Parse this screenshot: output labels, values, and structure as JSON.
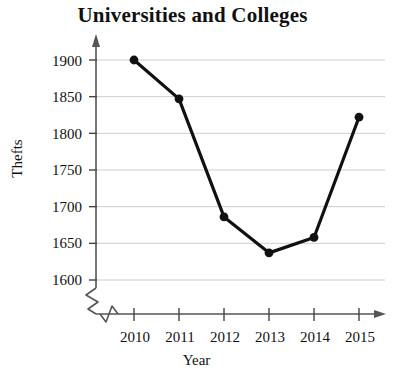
{
  "chart_data": {
    "type": "line",
    "title": "Universities and Colleges",
    "xlabel": "Year",
    "ylabel": "Thefts",
    "categories": [
      "2010",
      "2011",
      "2012",
      "2013",
      "2014",
      "2015"
    ],
    "values": [
      1900,
      1847,
      1686,
      1637,
      1658,
      1822
    ],
    "series": [
      {
        "name": "Thefts",
        "values": [
          1900,
          1847,
          1686,
          1637,
          1658,
          1822
        ]
      }
    ],
    "x": [
      2010,
      2011,
      2012,
      2013,
      2014,
      2015
    ],
    "ylim": [
      1600,
      1900
    ],
    "xlim": [
      2010,
      2015
    ],
    "yticks": [
      1600,
      1650,
      1700,
      1750,
      1800,
      1850,
      1900
    ],
    "xticks": [
      "2010",
      "2011",
      "2012",
      "2013",
      "2014",
      "2015"
    ],
    "grid": "horizontal",
    "legend": "none",
    "axis_break": "y-axis and x-axis show zigzag break near origin",
    "marker": "filled-circle",
    "line_color": "#111111",
    "grid_color": "#c8c8c8",
    "axis_color": "#555555"
  },
  "axes": {
    "y_tick_labels": [
      "1900",
      "1850",
      "1800",
      "1750",
      "1700",
      "1650",
      "1600"
    ],
    "x_tick_labels": [
      "2010",
      "2011",
      "2012",
      "2013",
      "2014",
      "2015"
    ]
  }
}
